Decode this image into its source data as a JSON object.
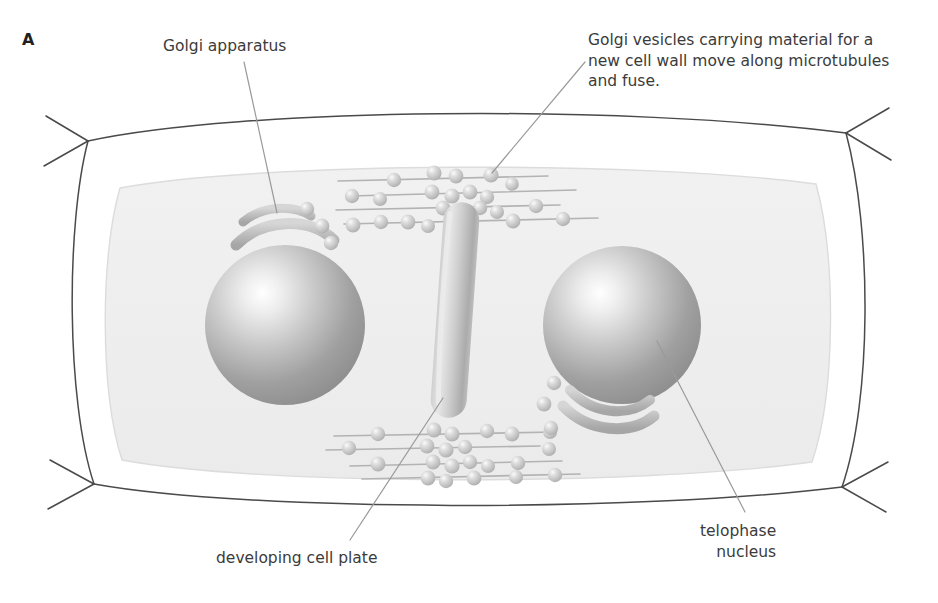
{
  "figure": {
    "panel_letter": "A"
  },
  "labels": {
    "golgi_apparatus": "Golgi apparatus",
    "golgi_vesicles": "Golgi vesicles carrying material for a\nnew cell wall move along microtubules\nand fuse.",
    "developing_cell_plate": "developing cell plate",
    "telophase_nucleus": "telophase\nnucleus"
  },
  "colors": {
    "background": "#ffffff",
    "cell_wall_stroke": "#4a4a4a",
    "cytoplasm_fill": "#eeeeee",
    "cytoplasm_stroke": "#d8d8d8",
    "nucleus_light": "#ffffff",
    "nucleus_mid": "#b9b9b9",
    "nucleus_dark": "#8a8a8a",
    "vesicle_fill": "#c9c9c9",
    "vesicle_highlight": "#f2f2f2",
    "microtubule_stroke": "#b0b0b0",
    "golgi_fill": "#c2c2c2",
    "cell_plate_fill": "#bdbdbd",
    "leader_line": "#9a9a9a",
    "text": "#3b3b3b"
  },
  "structures": {
    "nuclei": [
      {
        "name": "left-telophase-nucleus",
        "cx": 285,
        "cy": 325,
        "r": 80
      },
      {
        "name": "right-telophase-nucleus",
        "cx": 622,
        "cy": 325,
        "r": 79
      }
    ],
    "cell_plate": {
      "name": "developing-cell-plate",
      "cx": 455,
      "cy": 310,
      "length": 215,
      "width": 34
    },
    "golgi_stacks": [
      {
        "name": "golgi-left",
        "orientation": "concave-down"
      },
      {
        "name": "golgi-right",
        "orientation": "concave-up"
      }
    ],
    "microtubule_bands": [
      {
        "name": "microtubule-band-top",
        "y": 155,
        "lines": 4
      },
      {
        "name": "microtubule-band-bottom",
        "y": 430,
        "lines": 4
      }
    ],
    "vesicle_count_top": 22,
    "vesicle_count_bottom": 22
  }
}
